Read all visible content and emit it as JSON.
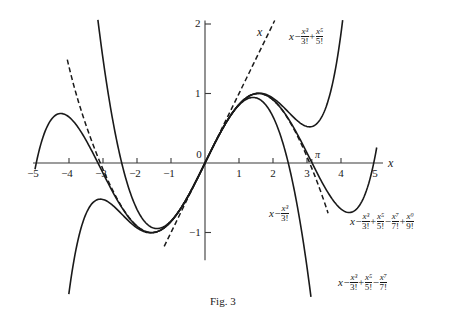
{
  "chart_data": {
    "type": "line",
    "title": "",
    "caption": "Fig. 3",
    "xlabel": "x",
    "ylabel": "",
    "xlim": [
      -5,
      5
    ],
    "ylim": [
      -2.3,
      2.1
    ],
    "grid": false,
    "x_ticks": [
      -5,
      -4,
      -3,
      -2,
      -1,
      0,
      1,
      2,
      3,
      4,
      5
    ],
    "x_tick_labels": [
      "−5",
      "−4",
      "−3",
      "−2",
      "−1",
      "0",
      "1",
      "2",
      "3",
      "4",
      "5"
    ],
    "y_ticks": [
      -1,
      1,
      2
    ],
    "y_tick_labels": [
      "−1",
      "1",
      "2"
    ],
    "annotations": [
      {
        "text": "π",
        "x": 3.14159,
        "y": 0
      }
    ],
    "series": [
      {
        "name": "x",
        "style": "dashed",
        "degree": 1,
        "x_range": [
          -1.2,
          2.05
        ]
      },
      {
        "name": "x - x^3/3!",
        "style": "solid",
        "degree": 3,
        "x_range": [
          -3.15,
          3.4
        ]
      },
      {
        "name": "x - x^3/3! + x^5/5!",
        "style": "solid",
        "degree": 5,
        "x_range": [
          -4.85,
          4.2
        ]
      },
      {
        "name": "x - x^3/3! + x^5/5! - x^7/7!",
        "style": "dashed",
        "degree": 7,
        "x_range": [
          -4.05,
          3.62
        ]
      },
      {
        "name": "x - x^3/3! + x^5/5! - x^7/7! + x^9/9!",
        "style": "solid",
        "degree": 9,
        "x_range": [
          -5.0,
          5.05
        ]
      }
    ]
  },
  "labels": {
    "x_axis": "x",
    "pi": "π",
    "line": "x",
    "t3": {
      "x": "x",
      "minus": "−",
      "n1": "x³",
      "d1": "3!"
    },
    "t5": {
      "x": "x",
      "minus": "−",
      "n1": "x³",
      "d1": "3!",
      "plus": "+",
      "n2": "x⁵",
      "d2": "5!"
    },
    "t7": {
      "x": "x",
      "minus": "−",
      "n1": "x³",
      "d1": "3!",
      "plus": "+",
      "n2": "x⁵",
      "d2": "5!",
      "minus2": "−",
      "n3": "x⁷",
      "d3": "7!"
    },
    "t9": {
      "x": "x",
      "minus": "−",
      "n1": "x³",
      "d1": "3!",
      "plus": "+",
      "n2": "x⁵",
      "d2": "5!",
      "minus2": "−",
      "n3": "x⁷",
      "d3": "7!",
      "plus2": "+",
      "n4": "x⁹",
      "d4": "9!"
    }
  }
}
